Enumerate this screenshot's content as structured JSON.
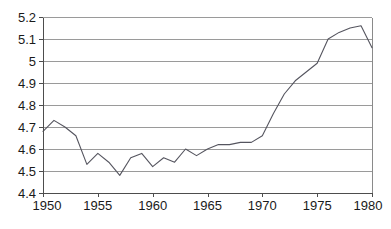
{
  "chart_data": {
    "type": "line",
    "title": "",
    "subtitle": "",
    "xlabel": "",
    "ylabel": "",
    "xlim": [
      1950,
      1980
    ],
    "ylim": [
      4.4,
      5.2
    ],
    "grid": true,
    "legend": false,
    "legend_position": "none",
    "y_ticks": [
      "4.4",
      "4.5",
      "4.6",
      "4.7",
      "4.8",
      "4.9",
      "5",
      "5.1",
      "5.2"
    ],
    "y_tick_values": [
      4.4,
      4.5,
      4.6,
      4.7,
      4.8,
      4.9,
      5.0,
      5.1,
      5.2
    ],
    "x_ticks": [
      "1950",
      "1955",
      "1960",
      "1965",
      "1970",
      "1975",
      "1980"
    ],
    "x_tick_values": [
      1950,
      1955,
      1960,
      1965,
      1970,
      1975,
      1980
    ],
    "x": [
      1950,
      1951,
      1952,
      1953,
      1954,
      1955,
      1956,
      1957,
      1958,
      1959,
      1960,
      1961,
      1962,
      1963,
      1964,
      1965,
      1966,
      1967,
      1968,
      1969,
      1970,
      1971,
      1972,
      1973,
      1974,
      1975,
      1976,
      1977,
      1978,
      1979,
      1980
    ],
    "values": [
      4.68,
      4.73,
      4.7,
      4.66,
      4.53,
      4.58,
      4.54,
      4.48,
      4.56,
      4.58,
      4.52,
      4.56,
      4.54,
      4.6,
      4.57,
      4.6,
      4.62,
      4.62,
      4.63,
      4.63,
      4.66,
      4.76,
      4.85,
      4.91,
      4.95,
      4.99,
      5.1,
      5.13,
      5.15,
      5.16,
      5.06
    ],
    "series": [
      {
        "name": "series-1",
        "color": "#55555f",
        "values": [
          4.68,
          4.73,
          4.7,
          4.66,
          4.53,
          4.58,
          4.54,
          4.48,
          4.56,
          4.58,
          4.52,
          4.56,
          4.54,
          4.6,
          4.57,
          4.6,
          4.62,
          4.62,
          4.63,
          4.63,
          4.66,
          4.76,
          4.85,
          4.91,
          4.95,
          4.99,
          5.1,
          5.13,
          5.15,
          5.16,
          5.06
        ]
      }
    ],
    "colors": {
      "line": "#55555f",
      "grid": "#9a9a9a",
      "axis": "#4d4d4d",
      "frame": "#8a8a8a",
      "text": "#1a1a1a",
      "background": "#ffffff"
    }
  },
  "plot_geometry": {
    "left": 43,
    "right": 372,
    "top": 17,
    "bottom": 193
  }
}
